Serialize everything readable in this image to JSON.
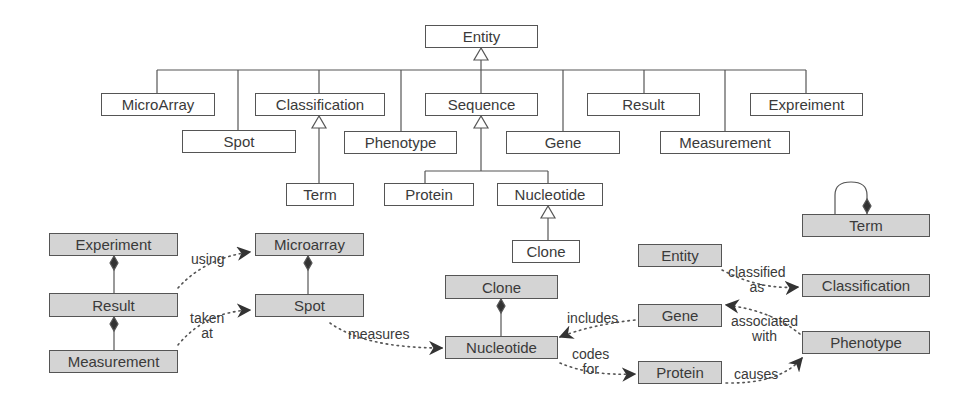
{
  "hierarchy": {
    "root": {
      "label": "Entity",
      "x": 425,
      "y": 25,
      "w": 113,
      "h": 23
    },
    "children": [
      {
        "id": "microarray",
        "label": "MicroArray",
        "x": 101,
        "y": 93,
        "w": 114,
        "h": 23
      },
      {
        "id": "spot",
        "label": "Spot",
        "x": 182,
        "y": 130,
        "w": 114,
        "h": 23
      },
      {
        "id": "classification",
        "label": "Classification",
        "x": 255,
        "y": 93,
        "w": 130,
        "h": 23
      },
      {
        "id": "phenotype",
        "label": "Phenotype",
        "x": 344,
        "y": 131,
        "w": 113,
        "h": 23
      },
      {
        "id": "sequence",
        "label": "Sequence",
        "x": 425,
        "y": 93,
        "w": 113,
        "h": 23
      },
      {
        "id": "gene",
        "label": "Gene",
        "x": 506,
        "y": 131,
        "w": 114,
        "h": 23
      },
      {
        "id": "result",
        "label": "Result",
        "x": 587,
        "y": 93,
        "w": 113,
        "h": 23
      },
      {
        "id": "measurement",
        "label": "Measurement",
        "x": 660,
        "y": 131,
        "w": 130,
        "h": 23
      },
      {
        "id": "expreiment",
        "label": "Expreiment",
        "x": 750,
        "y": 93,
        "w": 113,
        "h": 23
      }
    ],
    "grandchildren": [
      {
        "id": "term",
        "label": "Term",
        "x": 286,
        "y": 183,
        "w": 68,
        "h": 23,
        "parent": "classification"
      },
      {
        "id": "protein",
        "label": "Protein",
        "x": 384,
        "y": 183,
        "w": 90,
        "h": 23,
        "parent": "sequence"
      },
      {
        "id": "nucleotide",
        "label": "Nucleotide",
        "x": 497,
        "y": 183,
        "w": 106,
        "h": 23,
        "parent": "sequence"
      },
      {
        "id": "clone",
        "label": "Clone",
        "x": 512,
        "y": 240,
        "w": 68,
        "h": 23,
        "parent": "nucleotide"
      }
    ]
  },
  "associations": {
    "boxes": [
      {
        "id": "experiment",
        "label": "Experiment",
        "x": 49,
        "y": 233,
        "w": 129,
        "h": 23
      },
      {
        "id": "result",
        "label": "Result",
        "x": 49,
        "y": 293,
        "w": 129,
        "h": 24
      },
      {
        "id": "measurement",
        "label": "Measurement",
        "x": 49,
        "y": 350,
        "w": 129,
        "h": 23
      },
      {
        "id": "microarray",
        "label": "Microarray",
        "x": 255,
        "y": 233,
        "w": 109,
        "h": 23
      },
      {
        "id": "spot",
        "label": "Spot",
        "x": 255,
        "y": 294,
        "w": 109,
        "h": 23
      },
      {
        "id": "clone",
        "label": "Clone",
        "x": 445,
        "y": 275,
        "w": 113,
        "h": 24
      },
      {
        "id": "nucleotide",
        "label": "Nucleotide",
        "x": 445,
        "y": 336,
        "w": 113,
        "h": 23
      },
      {
        "id": "entity",
        "label": "Entity",
        "x": 638,
        "y": 244,
        "w": 84,
        "h": 23
      },
      {
        "id": "gene",
        "label": "Gene",
        "x": 638,
        "y": 304,
        "w": 84,
        "h": 23
      },
      {
        "id": "protein",
        "label": "Protein",
        "x": 638,
        "y": 361,
        "w": 84,
        "h": 23
      },
      {
        "id": "term",
        "label": "Term",
        "x": 802,
        "y": 214,
        "w": 128,
        "h": 23
      },
      {
        "id": "classification",
        "label": "Classification",
        "x": 802,
        "y": 274,
        "w": 128,
        "h": 23
      },
      {
        "id": "phenotype",
        "label": "Phenotype",
        "x": 802,
        "y": 331,
        "w": 128,
        "h": 23
      }
    ],
    "edge_labels": [
      {
        "id": "using",
        "text": "using",
        "x": 190,
        "y": 258
      },
      {
        "id": "taken-at",
        "text": "taken\nat",
        "x": 190,
        "y": 309
      },
      {
        "id": "measures",
        "text": "measures",
        "x": 349,
        "y": 328
      },
      {
        "id": "includes",
        "text": "includes",
        "x": 568,
        "y": 313
      },
      {
        "id": "codes-for",
        "text": "codes\nfor",
        "x": 570,
        "y": 346
      },
      {
        "id": "classified-as",
        "text": "classified\nas",
        "x": 728,
        "y": 262
      },
      {
        "id": "associated-with",
        "text": "associated\nwith",
        "x": 733,
        "y": 313
      },
      {
        "id": "causes",
        "text": "causes",
        "x": 735,
        "y": 366
      }
    ]
  },
  "colors": {
    "line": "#555555",
    "box_fill_gray": "#d4d4d4",
    "box_fill_white": "#ffffff",
    "text": "#3a3a3a"
  }
}
